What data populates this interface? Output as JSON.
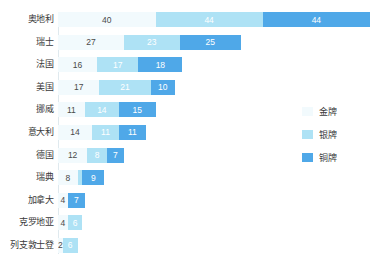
{
  "chart_data": {
    "type": "bar",
    "title": "",
    "subtitle": "",
    "xlabel": "",
    "ylabel": "",
    "orientation": "horizontal",
    "stacked": true,
    "grid": false,
    "legend_position": "right",
    "xlim": [
      0,
      128
    ],
    "categories": [
      "奥地利",
      "瑞士",
      "法国",
      "美国",
      "挪威",
      "意大利",
      "德国",
      "瑞典",
      "加拿大",
      "克罗地亚",
      "列支敦士登"
    ],
    "series": [
      {
        "name": "金牌",
        "color": "#f2fafd",
        "values": [
          40,
          27,
          16,
          17,
          11,
          14,
          12,
          8,
          4,
          4,
          2
        ]
      },
      {
        "name": "银牌",
        "color": "#aee2f5",
        "values": [
          44,
          23,
          17,
          21,
          14,
          11,
          8,
          2,
          0,
          6,
          6
        ]
      },
      {
        "name": "铜牌",
        "color": "#4fa8e8",
        "values": [
          44,
          25,
          18,
          10,
          15,
          11,
          7,
          9,
          7,
          0,
          0
        ]
      }
    ],
    "rows": [
      {
        "category": "奥地利",
        "gold": 40,
        "gold_label": "40",
        "silver": 44,
        "silver_label": "44",
        "bronze": 44,
        "bronze_label": "44"
      },
      {
        "category": "瑞士",
        "gold": 27,
        "gold_label": "27",
        "silver": 23,
        "silver_label": "23",
        "bronze": 25,
        "bronze_label": "25"
      },
      {
        "category": "法国",
        "gold": 16,
        "gold_label": "16",
        "silver": 17,
        "silver_label": "17",
        "bronze": 18,
        "bronze_label": "18"
      },
      {
        "category": "美国",
        "gold": 17,
        "gold_label": "17",
        "silver": 21,
        "silver_label": "21",
        "bronze": 10,
        "bronze_label": "10"
      },
      {
        "category": "挪威",
        "gold": 11,
        "gold_label": "11",
        "silver": 14,
        "silver_label": "14",
        "bronze": 15,
        "bronze_label": "15"
      },
      {
        "category": "意大利",
        "gold": 14,
        "gold_label": "14",
        "silver": 11,
        "silver_label": "11",
        "bronze": 11,
        "bronze_label": "11"
      },
      {
        "category": "德国",
        "gold": 12,
        "gold_label": "12",
        "silver": 8,
        "silver_label": "8",
        "bronze": 7,
        "bronze_label": "7"
      },
      {
        "category": "瑞典",
        "gold": 8,
        "gold_label": "8",
        "silver": 2,
        "silver_label": "",
        "bronze": 9,
        "bronze_label": "9"
      },
      {
        "category": "加拿大",
        "gold": 4,
        "gold_label": "4",
        "silver": 0,
        "silver_label": "",
        "bronze": 7,
        "bronze_label": "7"
      },
      {
        "category": "克罗地亚",
        "gold": 4,
        "gold_label": "4",
        "silver": 6,
        "silver_label": "6",
        "bronze": 0,
        "bronze_label": ""
      },
      {
        "category": "列支敦士登",
        "gold": 2,
        "gold_label": "2",
        "silver": 6,
        "silver_label": "6",
        "bronze": 0,
        "bronze_label": ""
      }
    ]
  },
  "legend": {
    "items": [
      {
        "label": "金牌",
        "color": "#f2fafd"
      },
      {
        "label": "银牌",
        "color": "#aee2f5"
      },
      {
        "label": "铜牌",
        "color": "#4fa8e8"
      }
    ]
  }
}
